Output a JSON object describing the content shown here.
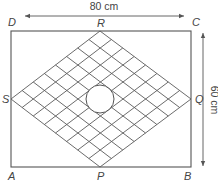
{
  "diagram": {
    "colors": {
      "stroke": "#555555",
      "grid": "#5a5a5a",
      "text": "#444444",
      "background": "#ffffff"
    },
    "rectangle": {
      "x1": 11,
      "y1": 31,
      "x2": 191,
      "y2": 167
    },
    "rhombus": {
      "P": [
        100,
        167
      ],
      "Q": [
        191,
        99
      ],
      "R": [
        100,
        31
      ],
      "S": [
        11,
        99
      ],
      "divisions": 8
    },
    "circle": {
      "cx": 100,
      "cy": 99,
      "r": 14
    },
    "vertex_labels": [
      {
        "name": "D",
        "x": 8,
        "y": 26
      },
      {
        "name": "C",
        "x": 192,
        "y": 26
      },
      {
        "name": "A",
        "x": 8,
        "y": 180
      },
      {
        "name": "B",
        "x": 184,
        "y": 180
      },
      {
        "name": "R",
        "x": 97,
        "y": 27
      },
      {
        "name": "P",
        "x": 97,
        "y": 180
      },
      {
        "name": "S",
        "x": 2,
        "y": 103
      },
      {
        "name": "Q",
        "x": 195,
        "y": 103
      }
    ],
    "dimensions": {
      "width": {
        "label": "80 cm",
        "x1": 25,
        "x2": 184,
        "y": 16,
        "label_x": 104,
        "label_y": 10
      },
      "height": {
        "label": "60 cm",
        "y1": 33,
        "y2": 166,
        "x": 203,
        "label_x": 211,
        "label_y": 100
      }
    }
  }
}
